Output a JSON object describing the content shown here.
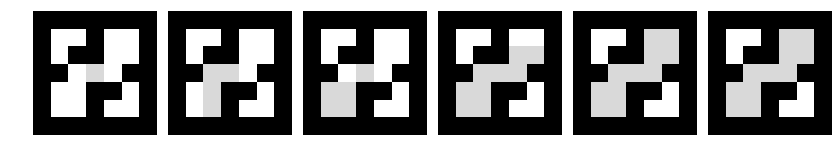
{
  "figure": {
    "name": "flood-fill-maze-sequence",
    "panel_count": 6,
    "grid_rows": 7,
    "grid_cols": 7,
    "colors": {
      "wall": "#000000",
      "open": "#ffffff",
      "fill": "#d9d9d9",
      "background": "#ffffff"
    },
    "legend": {
      "wall_label": "wall",
      "open_label": "open",
      "fill_label": "flooded"
    }
  },
  "chart_data": {
    "type": "heatmap",
    "title": "",
    "xlabel": "",
    "ylabel": "",
    "categories": [
      "frame 1",
      "frame 2",
      "frame 3",
      "frame 4",
      "frame 5",
      "frame 6"
    ],
    "legend_position": "none",
    "grid": false,
    "cell_codes": {
      "0": "open",
      "1": "wall",
      "2": "fill"
    },
    "flooded_cell_counts": [
      1,
      4,
      8,
      13,
      18,
      22
    ],
    "panels": [
      {
        "index": 1,
        "label": "frame 1",
        "flooded_count": 1,
        "matrix": [
          [
            1,
            1,
            1,
            1,
            1,
            1,
            1
          ],
          [
            1,
            0,
            0,
            1,
            0,
            0,
            1
          ],
          [
            1,
            0,
            1,
            1,
            0,
            0,
            1
          ],
          [
            1,
            1,
            0,
            2,
            0,
            1,
            1
          ],
          [
            1,
            0,
            0,
            1,
            1,
            0,
            1
          ],
          [
            1,
            0,
            0,
            1,
            0,
            0,
            1
          ],
          [
            1,
            1,
            1,
            1,
            1,
            1,
            1
          ]
        ]
      },
      {
        "index": 2,
        "label": "frame 2",
        "flooded_count": 4,
        "matrix": [
          [
            1,
            1,
            1,
            1,
            1,
            1,
            1
          ],
          [
            1,
            0,
            0,
            1,
            0,
            0,
            1
          ],
          [
            1,
            0,
            1,
            1,
            0,
            0,
            1
          ],
          [
            1,
            1,
            2,
            2,
            0,
            1,
            1
          ],
          [
            1,
            0,
            2,
            1,
            1,
            0,
            1
          ],
          [
            1,
            0,
            2,
            1,
            0,
            0,
            1
          ],
          [
            1,
            1,
            1,
            1,
            1,
            1,
            1
          ]
        ]
      },
      {
        "index": 3,
        "label": "frame 3",
        "flooded_count": 8,
        "matrix": [
          [
            1,
            1,
            1,
            1,
            1,
            1,
            1
          ],
          [
            1,
            0,
            0,
            1,
            0,
            0,
            1
          ],
          [
            1,
            0,
            1,
            1,
            0,
            0,
            1
          ],
          [
            1,
            1,
            0,
            2,
            0,
            1,
            1
          ],
          [
            1,
            2,
            2,
            1,
            1,
            0,
            1
          ],
          [
            1,
            2,
            2,
            1,
            0,
            0,
            1
          ],
          [
            1,
            1,
            1,
            1,
            1,
            1,
            1
          ]
        ]
      },
      {
        "index": 4,
        "label": "frame 4",
        "flooded_count": 13,
        "matrix": [
          [
            1,
            1,
            1,
            1,
            1,
            1,
            1
          ],
          [
            1,
            0,
            0,
            1,
            0,
            0,
            1
          ],
          [
            1,
            0,
            1,
            1,
            2,
            2,
            1
          ],
          [
            1,
            1,
            2,
            2,
            2,
            1,
            1
          ],
          [
            1,
            2,
            2,
            1,
            1,
            0,
            1
          ],
          [
            1,
            2,
            2,
            1,
            0,
            0,
            1
          ],
          [
            1,
            1,
            1,
            1,
            1,
            1,
            1
          ]
        ]
      },
      {
        "index": 5,
        "label": "frame 5",
        "flooded_count": 18,
        "matrix": [
          [
            1,
            1,
            1,
            1,
            1,
            1,
            1
          ],
          [
            1,
            0,
            0,
            1,
            2,
            2,
            1
          ],
          [
            1,
            0,
            1,
            1,
            2,
            2,
            1
          ],
          [
            1,
            1,
            2,
            2,
            2,
            1,
            1
          ],
          [
            1,
            2,
            2,
            1,
            1,
            0,
            1
          ],
          [
            1,
            2,
            2,
            1,
            0,
            0,
            1
          ],
          [
            1,
            1,
            1,
            1,
            1,
            1,
            1
          ]
        ]
      },
      {
        "index": 6,
        "label": "frame 6",
        "flooded_count": 22,
        "matrix": [
          [
            1,
            1,
            1,
            1,
            1,
            1,
            1
          ],
          [
            1,
            0,
            0,
            1,
            2,
            2,
            1
          ],
          [
            1,
            0,
            1,
            1,
            2,
            2,
            1
          ],
          [
            1,
            1,
            2,
            2,
            2,
            1,
            1
          ],
          [
            1,
            2,
            2,
            1,
            1,
            0,
            1
          ],
          [
            1,
            2,
            2,
            1,
            0,
            0,
            1
          ],
          [
            1,
            1,
            1,
            1,
            1,
            1,
            1
          ]
        ]
      }
    ]
  }
}
